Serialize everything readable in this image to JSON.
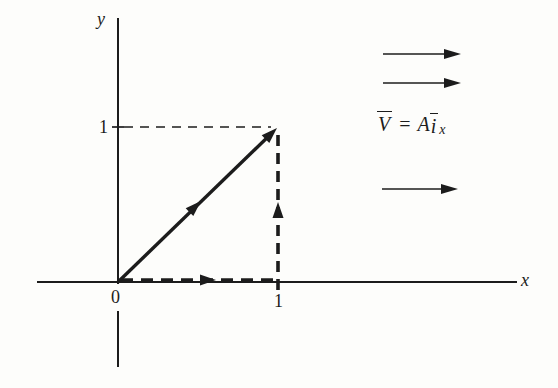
{
  "figure": {
    "colors": {
      "background": "#fdfdfb",
      "ink": "#1c1c1c"
    },
    "axes": {
      "x_label": "x",
      "y_label": "y",
      "origin_label": "0",
      "x_tick_label": "1",
      "y_tick_label": "1"
    },
    "equation": {
      "lhs": "V",
      "equals": "=",
      "coefficient": "A",
      "unit_vector": "i",
      "subscript": "x"
    },
    "diagram": {
      "type": "vector-path-diagram",
      "solid_vector": {
        "from": [
          0,
          0
        ],
        "to": [
          1,
          1
        ],
        "style": "solid-thick",
        "arrowheads": [
          "middle",
          "tip"
        ]
      },
      "dashed_path": [
        {
          "from": [
            0,
            0
          ],
          "to": [
            1,
            0
          ],
          "style": "dashed-thick",
          "arrowhead": "middle-right"
        },
        {
          "from": [
            1,
            0
          ],
          "to": [
            1,
            1
          ],
          "style": "dashed-thick",
          "arrowhead": "middle-up"
        }
      ],
      "reference_dashed_line": {
        "from": [
          0,
          1
        ],
        "to": [
          1,
          1
        ],
        "style": "dashed-thin"
      },
      "field_arrows": {
        "count": 3,
        "direction": "right"
      }
    }
  }
}
